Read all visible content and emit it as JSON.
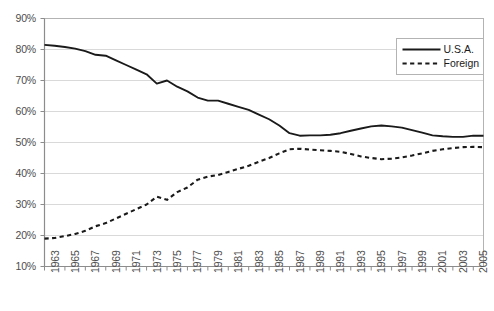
{
  "chart_data": {
    "type": "line",
    "title": "",
    "xlabel": "",
    "ylabel": "",
    "ylim": [
      10,
      90
    ],
    "xlim": [
      1963,
      2006
    ],
    "ytick_labels": [
      "90%",
      "80%",
      "70%",
      "60%",
      "50%",
      "40%",
      "30%",
      "20%",
      "10%"
    ],
    "ytick_values": [
      90,
      80,
      70,
      60,
      50,
      40,
      30,
      20,
      10
    ],
    "xtick_labels": [
      "1963",
      "1965",
      "1967",
      "1969",
      "1971",
      "1973",
      "1975",
      "1977",
      "1979",
      "1981",
      "1983",
      "1985",
      "1987",
      "1989",
      "1991",
      "1993",
      "1995",
      "1997",
      "1999",
      "2001",
      "2003",
      "2005"
    ],
    "xtick_values": [
      1963,
      1965,
      1967,
      1969,
      1971,
      1973,
      1975,
      1977,
      1979,
      1981,
      1983,
      1985,
      1987,
      1989,
      1991,
      1993,
      1995,
      1997,
      1999,
      2001,
      2003,
      2005
    ],
    "grid": "horizontal",
    "legend_position": "top-right",
    "x": [
      1963,
      1964,
      1965,
      1966,
      1967,
      1968,
      1969,
      1970,
      1971,
      1972,
      1973,
      1974,
      1975,
      1976,
      1977,
      1978,
      1979,
      1980,
      1981,
      1982,
      1983,
      1984,
      1985,
      1986,
      1987,
      1988,
      1989,
      1990,
      1991,
      1992,
      1993,
      1994,
      1995,
      1996,
      1997,
      1998,
      1999,
      2000,
      2001,
      2002,
      2003,
      2004,
      2005,
      2006
    ],
    "series": [
      {
        "name": "U.S.A.",
        "style": "solid",
        "color": "#1a1a1a",
        "values": [
          81.5,
          81.2,
          80.8,
          80.3,
          79.5,
          78.3,
          78.0,
          76.5,
          75.0,
          73.5,
          72.0,
          69.0,
          70.0,
          68.0,
          66.5,
          64.5,
          63.5,
          63.5,
          62.5,
          61.5,
          60.5,
          59.0,
          57.5,
          55.5,
          53.0,
          52.2,
          52.3,
          52.3,
          52.5,
          53.0,
          53.8,
          54.5,
          55.2,
          55.5,
          55.2,
          54.8,
          54.0,
          53.2,
          52.3,
          52.0,
          51.8,
          51.8,
          52.2,
          52.2
        ]
      },
      {
        "name": "Foreign",
        "style": "dashed",
        "color": "#1a1a1a",
        "values": [
          19.0,
          19.2,
          19.8,
          20.5,
          21.5,
          23.0,
          24.0,
          25.5,
          27.0,
          28.5,
          30.0,
          32.5,
          31.5,
          34.0,
          35.5,
          38.0,
          39.0,
          39.5,
          40.5,
          41.5,
          42.5,
          43.8,
          45.0,
          46.5,
          47.8,
          48.0,
          47.7,
          47.5,
          47.3,
          47.0,
          46.3,
          45.5,
          45.0,
          44.6,
          44.8,
          45.2,
          45.8,
          46.5,
          47.3,
          47.8,
          48.2,
          48.5,
          48.6,
          48.5
        ]
      }
    ]
  },
  "legend": {
    "items": [
      {
        "label": "U.S.A.",
        "style": "solid"
      },
      {
        "label": "Foreign",
        "style": "dashed"
      }
    ]
  }
}
